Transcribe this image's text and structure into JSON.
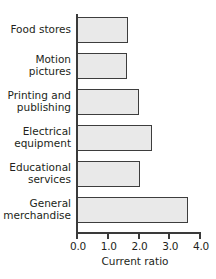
{
  "chart_data": {
    "type": "bar",
    "orientation": "horizontal",
    "title": "",
    "xlabel": "Current ratio",
    "ylabel": "",
    "xlim": [
      0.0,
      4.0
    ],
    "grid": false,
    "legend": null,
    "categories": [
      "Food stores",
      "Motion pictures",
      "Printing and publishing",
      "Electrical equipment",
      "Educational services",
      "General merchandise"
    ],
    "category_lines": [
      [
        "Food stores"
      ],
      [
        "Motion",
        "pictures"
      ],
      [
        "Printing and",
        "publishing"
      ],
      [
        "Electrical",
        "equipment"
      ],
      [
        "Educational",
        "services"
      ],
      [
        "General",
        "merchandise"
      ]
    ],
    "values": [
      1.65,
      1.62,
      2.0,
      2.45,
      2.05,
      3.6
    ],
    "xticks": [
      0.0,
      1.0,
      2.0,
      3.0,
      4.0
    ],
    "xtick_labels": [
      "0.0",
      "1.0",
      "2.0",
      "3.0",
      "4.0"
    ],
    "bar_fill_color": "#e9e9e9",
    "bar_edge_color": "#3d3d3d",
    "axis_color": "#3a3a3a",
    "background_color": "#ffffff"
  }
}
